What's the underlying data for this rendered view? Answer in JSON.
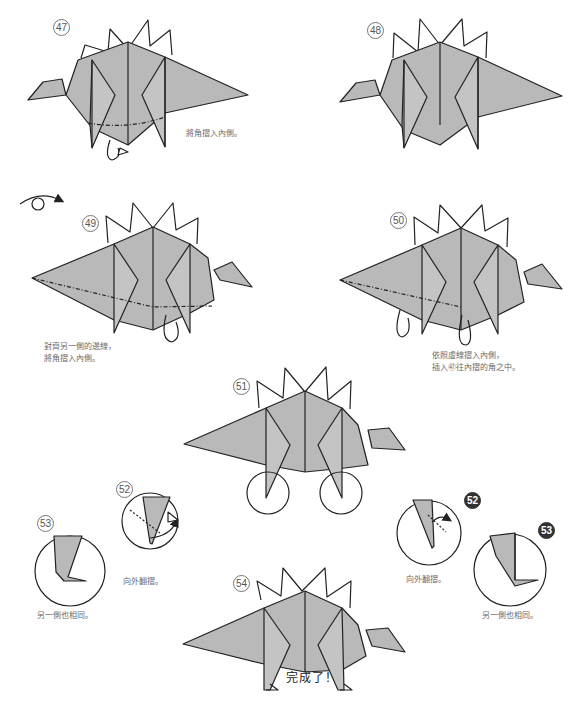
{
  "document": {
    "type": "origami-instructions",
    "subject": "stegosaurus"
  },
  "steps": [
    {
      "number": "47",
      "style": "outline",
      "caption": [
        "將角摺入內側。"
      ]
    },
    {
      "number": "48",
      "style": "outline",
      "caption": []
    },
    {
      "number": "49",
      "style": "outline",
      "caption": [
        "對齊另一側的邊線，",
        "將角摺入內側。"
      ],
      "symbol": "turn-over-icon"
    },
    {
      "number": "50",
      "style": "outline",
      "caption": [
        "依照虛線摺入內側，",
        "插入㊼往內摺的角之中。"
      ]
    },
    {
      "number": "51",
      "style": "outline",
      "caption": []
    },
    {
      "number": "52",
      "style": "outline",
      "caption": [
        "向外翻摺。"
      ]
    },
    {
      "number": "53",
      "style": "outline",
      "caption": [
        "另一側也相同。"
      ]
    },
    {
      "number": "52",
      "style": "filled",
      "caption": [
        "向外翻摺。"
      ]
    },
    {
      "number": "53",
      "style": "filled",
      "caption": [
        "另一側也相同。"
      ]
    },
    {
      "number": "54",
      "style": "outline",
      "caption": []
    }
  ],
  "final_caption": "完成了！",
  "colors": {
    "paper_fill": "#b9b9b9",
    "line": "#222222",
    "caption_text": "#6a6a6a",
    "background": "#ffffff"
  }
}
